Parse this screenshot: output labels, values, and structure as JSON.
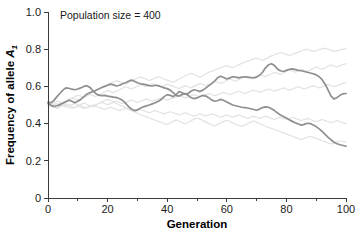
{
  "chart_data": {
    "type": "line",
    "title": "",
    "annotation": "Population size = 400",
    "xlabel": "Generation",
    "ylabel": "Frequency of allele A",
    "ylabel_subscript": "1",
    "xlim": [
      0,
      100
    ],
    "ylim": [
      0,
      1.0
    ],
    "xticks": [
      0,
      20,
      40,
      60,
      80,
      100
    ],
    "xtick_labels": [
      "0",
      "20",
      "40",
      "60",
      "80",
      "100"
    ],
    "xminor_ticks": [
      10,
      30,
      50,
      70,
      90
    ],
    "yticks": [
      0,
      0.2,
      0.4,
      0.6,
      0.8,
      1.0
    ],
    "ytick_labels": [
      "0",
      "0.2",
      "0.4",
      "0.6",
      "0.8",
      "1.0"
    ],
    "grid": false,
    "legend": "none",
    "colors": {
      "main_trace": "#8f8f8f",
      "faint_trace": "#e2e2e2",
      "axis": "#3a3a3a",
      "text": "#1a1a1a"
    },
    "x": [
      0,
      1,
      2,
      3,
      4,
      5,
      6,
      7,
      8,
      9,
      10,
      11,
      12,
      13,
      14,
      15,
      16,
      17,
      18,
      19,
      20,
      21,
      22,
      23,
      24,
      25,
      26,
      27,
      28,
      29,
      30,
      31,
      32,
      33,
      34,
      35,
      36,
      37,
      38,
      39,
      40,
      41,
      42,
      43,
      44,
      45,
      46,
      47,
      48,
      49,
      50,
      51,
      52,
      53,
      54,
      55,
      56,
      57,
      58,
      59,
      60,
      61,
      62,
      63,
      64,
      65,
      66,
      67,
      68,
      69,
      70,
      71,
      72,
      73,
      74,
      75,
      76,
      77,
      78,
      79,
      80,
      81,
      82,
      83,
      84,
      85,
      86,
      87,
      88,
      89,
      90,
      91,
      92,
      93,
      94,
      95,
      96,
      97,
      98,
      99,
      100
    ],
    "series": [
      {
        "name": "replicate-1",
        "emphasis": "main",
        "values": [
          0.515,
          0.512,
          0.525,
          0.545,
          0.562,
          0.58,
          0.592,
          0.59,
          0.585,
          0.582,
          0.586,
          0.592,
          0.6,
          0.604,
          0.596,
          0.578,
          0.562,
          0.553,
          0.55,
          0.552,
          0.548,
          0.545,
          0.542,
          0.54,
          0.534,
          0.525,
          0.51,
          0.492,
          0.478,
          0.47,
          0.474,
          0.482,
          0.49,
          0.495,
          0.5,
          0.506,
          0.512,
          0.52,
          0.53,
          0.545,
          0.556,
          0.552,
          0.545,
          0.556,
          0.572,
          0.566,
          0.558,
          0.562,
          0.574,
          0.582,
          0.578,
          0.572,
          0.58,
          0.592,
          0.604,
          0.616,
          0.63,
          0.648,
          0.655,
          0.648,
          0.64,
          0.646,
          0.652,
          0.65,
          0.646,
          0.65,
          0.652,
          0.65,
          0.648,
          0.646,
          0.65,
          0.66,
          0.676,
          0.7,
          0.716,
          0.722,
          0.712,
          0.694,
          0.684,
          0.68,
          0.686,
          0.692,
          0.694,
          0.69,
          0.686,
          0.684,
          0.68,
          0.676,
          0.672,
          0.668,
          0.662,
          0.652,
          0.636,
          0.612,
          0.58,
          0.548,
          0.532,
          0.54,
          0.552,
          0.56,
          0.562
        ]
      },
      {
        "name": "replicate-2",
        "emphasis": "main",
        "values": [
          0.51,
          0.498,
          0.492,
          0.496,
          0.502,
          0.51,
          0.518,
          0.526,
          0.52,
          0.512,
          0.52,
          0.53,
          0.544,
          0.558,
          0.566,
          0.572,
          0.578,
          0.586,
          0.594,
          0.6,
          0.606,
          0.612,
          0.608,
          0.602,
          0.606,
          0.614,
          0.62,
          0.628,
          0.634,
          0.628,
          0.62,
          0.614,
          0.612,
          0.608,
          0.604,
          0.602,
          0.606,
          0.604,
          0.598,
          0.592,
          0.588,
          0.58,
          0.566,
          0.552,
          0.548,
          0.556,
          0.562,
          0.552,
          0.54,
          0.534,
          0.538,
          0.546,
          0.552,
          0.548,
          0.538,
          0.526,
          0.52,
          0.524,
          0.53,
          0.524,
          0.516,
          0.508,
          0.5,
          0.496,
          0.492,
          0.488,
          0.486,
          0.484,
          0.48,
          0.476,
          0.472,
          0.478,
          0.486,
          0.49,
          0.488,
          0.48,
          0.47,
          0.458,
          0.446,
          0.438,
          0.43,
          0.42,
          0.412,
          0.404,
          0.398,
          0.392,
          0.396,
          0.402,
          0.4,
          0.392,
          0.384,
          0.372,
          0.358,
          0.342,
          0.326,
          0.312,
          0.3,
          0.292,
          0.286,
          0.282,
          0.278
        ]
      },
      {
        "name": "replicate-3",
        "emphasis": "faint",
        "values": [
          0.5,
          0.505,
          0.512,
          0.52,
          0.516,
          0.51,
          0.518,
          0.528,
          0.536,
          0.544,
          0.552,
          0.548,
          0.542,
          0.55,
          0.562,
          0.572,
          0.58,
          0.586,
          0.592,
          0.6,
          0.61,
          0.618,
          0.624,
          0.63,
          0.626,
          0.618,
          0.612,
          0.62,
          0.63,
          0.638,
          0.644,
          0.65,
          0.646,
          0.638,
          0.632,
          0.638,
          0.646,
          0.652,
          0.648,
          0.64,
          0.634,
          0.628,
          0.622,
          0.63,
          0.64,
          0.648,
          0.656,
          0.664,
          0.67,
          0.664,
          0.656,
          0.65,
          0.658,
          0.668,
          0.676,
          0.682,
          0.688,
          0.694,
          0.7,
          0.706,
          0.712,
          0.706,
          0.7,
          0.708,
          0.716,
          0.724,
          0.73,
          0.736,
          0.742,
          0.748,
          0.752,
          0.746,
          0.74,
          0.748,
          0.756,
          0.764,
          0.77,
          0.776,
          0.782,
          0.778,
          0.772,
          0.766,
          0.772,
          0.778,
          0.784,
          0.79,
          0.796,
          0.8,
          0.794,
          0.788,
          0.792,
          0.798,
          0.802,
          0.806,
          0.8,
          0.794,
          0.788,
          0.792,
          0.796,
          0.8,
          0.802
        ]
      },
      {
        "name": "replicate-4",
        "emphasis": "faint",
        "values": [
          0.498,
          0.494,
          0.488,
          0.482,
          0.49,
          0.498,
          0.506,
          0.5,
          0.492,
          0.486,
          0.494,
          0.502,
          0.51,
          0.504,
          0.496,
          0.49,
          0.498,
          0.508,
          0.516,
          0.524,
          0.53,
          0.524,
          0.516,
          0.508,
          0.5,
          0.494,
          0.486,
          0.478,
          0.47,
          0.464,
          0.456,
          0.448,
          0.442,
          0.436,
          0.43,
          0.424,
          0.418,
          0.412,
          0.406,
          0.4,
          0.396,
          0.404,
          0.412,
          0.42,
          0.414,
          0.406,
          0.398,
          0.406,
          0.416,
          0.424,
          0.43,
          0.424,
          0.416,
          0.408,
          0.4,
          0.394,
          0.388,
          0.396,
          0.404,
          0.412,
          0.418,
          0.412,
          0.404,
          0.396,
          0.39,
          0.384,
          0.392,
          0.4,
          0.408,
          0.414,
          0.408,
          0.4,
          0.394,
          0.386,
          0.38,
          0.374,
          0.368,
          0.362,
          0.356,
          0.35,
          0.344,
          0.338,
          0.332,
          0.326,
          0.32,
          0.314,
          0.32,
          0.326,
          0.332,
          0.326,
          0.32,
          0.314,
          0.308,
          0.302,
          0.296,
          0.29,
          0.296,
          0.302,
          0.308,
          0.304,
          0.3
        ]
      },
      {
        "name": "replicate-5",
        "emphasis": "faint",
        "values": [
          0.505,
          0.51,
          0.504,
          0.498,
          0.506,
          0.514,
          0.522,
          0.53,
          0.538,
          0.532,
          0.526,
          0.534,
          0.542,
          0.55,
          0.558,
          0.552,
          0.546,
          0.554,
          0.562,
          0.57,
          0.578,
          0.572,
          0.566,
          0.574,
          0.582,
          0.59,
          0.598,
          0.592,
          0.586,
          0.594,
          0.602,
          0.61,
          0.604,
          0.598,
          0.606,
          0.614,
          0.608,
          0.602,
          0.596,
          0.604,
          0.612,
          0.606,
          0.6,
          0.594,
          0.588,
          0.596,
          0.604,
          0.598,
          0.592,
          0.6,
          0.608,
          0.616,
          0.61,
          0.604,
          0.612,
          0.62,
          0.628,
          0.622,
          0.616,
          0.624,
          0.632,
          0.64,
          0.634,
          0.628,
          0.636,
          0.644,
          0.652,
          0.646,
          0.64,
          0.648,
          0.656,
          0.664,
          0.658,
          0.652,
          0.66,
          0.668,
          0.676,
          0.67,
          0.664,
          0.672,
          0.68,
          0.688,
          0.682,
          0.676,
          0.684,
          0.692,
          0.686,
          0.68,
          0.688,
          0.696,
          0.704,
          0.698,
          0.692,
          0.7,
          0.708,
          0.716,
          0.71,
          0.704,
          0.712,
          0.718,
          0.722
        ]
      },
      {
        "name": "replicate-6",
        "emphasis": "faint",
        "values": [
          0.502,
          0.496,
          0.502,
          0.508,
          0.502,
          0.496,
          0.49,
          0.496,
          0.502,
          0.508,
          0.502,
          0.496,
          0.49,
          0.484,
          0.49,
          0.496,
          0.502,
          0.508,
          0.514,
          0.508,
          0.502,
          0.508,
          0.514,
          0.52,
          0.514,
          0.508,
          0.514,
          0.52,
          0.526,
          0.52,
          0.514,
          0.52,
          0.526,
          0.532,
          0.526,
          0.52,
          0.526,
          0.532,
          0.538,
          0.532,
          0.526,
          0.532,
          0.538,
          0.544,
          0.55,
          0.544,
          0.538,
          0.544,
          0.55,
          0.556,
          0.55,
          0.544,
          0.55,
          0.556,
          0.562,
          0.556,
          0.55,
          0.556,
          0.562,
          0.568,
          0.562,
          0.556,
          0.562,
          0.568,
          0.574,
          0.568,
          0.562,
          0.568,
          0.574,
          0.58,
          0.574,
          0.568,
          0.574,
          0.58,
          0.586,
          0.58,
          0.574,
          0.58,
          0.586,
          0.592,
          0.586,
          0.58,
          0.586,
          0.592,
          0.598,
          0.592,
          0.586,
          0.592,
          0.598,
          0.604,
          0.598,
          0.592,
          0.598,
          0.604,
          0.61,
          0.604,
          0.598,
          0.604,
          0.61,
          0.616,
          0.62
        ]
      },
      {
        "name": "replicate-7",
        "emphasis": "faint",
        "values": [
          0.495,
          0.5,
          0.494,
          0.488,
          0.494,
          0.5,
          0.494,
          0.488,
          0.482,
          0.488,
          0.494,
          0.488,
          0.482,
          0.488,
          0.494,
          0.5,
          0.494,
          0.488,
          0.482,
          0.476,
          0.482,
          0.488,
          0.482,
          0.476,
          0.47,
          0.476,
          0.482,
          0.476,
          0.47,
          0.464,
          0.47,
          0.476,
          0.47,
          0.464,
          0.458,
          0.464,
          0.47,
          0.464,
          0.458,
          0.452,
          0.458,
          0.464,
          0.458,
          0.452,
          0.446,
          0.452,
          0.458,
          0.452,
          0.446,
          0.44,
          0.446,
          0.452,
          0.446,
          0.44,
          0.446,
          0.452,
          0.446,
          0.44,
          0.434,
          0.44,
          0.446,
          0.44,
          0.434,
          0.44,
          0.446,
          0.44,
          0.434,
          0.428,
          0.434,
          0.44,
          0.434,
          0.428,
          0.434,
          0.44,
          0.434,
          0.428,
          0.422,
          0.428,
          0.434,
          0.428,
          0.422,
          0.428,
          0.434,
          0.428,
          0.422,
          0.416,
          0.422,
          0.428,
          0.422,
          0.416,
          0.41,
          0.416,
          0.422,
          0.416,
          0.41,
          0.404,
          0.41,
          0.416,
          0.41,
          0.404,
          0.4
        ]
      }
    ]
  }
}
